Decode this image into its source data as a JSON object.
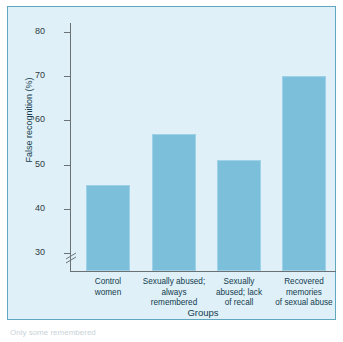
{
  "figure": {
    "panel_background": "#dff0f8",
    "panel_border": "#5fa8bf",
    "bar_color": "#7cbfdb",
    "caption_fragment": "Only some remembered"
  },
  "chart_data": {
    "type": "bar",
    "title": "",
    "xlabel": "Groups",
    "ylabel": "False recognition (%)",
    "categories": [
      "Control women",
      "Sexually abused; always remembered",
      "Sexually abused; lack of recall",
      "Recovered memories of sexual abuse"
    ],
    "category_lines": [
      [
        "Control",
        "women"
      ],
      [
        "Sexually abused;",
        "always",
        "remembered"
      ],
      [
        "Sexually",
        "abused; lack",
        "of recall"
      ],
      [
        "Recovered",
        "memories",
        "of sexual abuse"
      ]
    ],
    "values": [
      45.5,
      57,
      51,
      70
    ],
    "ylim": [
      26,
      82
    ],
    "yticks": [
      30,
      40,
      50,
      60,
      70,
      80
    ],
    "ytick_labels": [
      "30",
      "40",
      "50",
      "60",
      "70",
      "80"
    ],
    "axis_break": true,
    "axis_break_note": "y-axis broken below 30",
    "grid": false,
    "legend": false
  }
}
